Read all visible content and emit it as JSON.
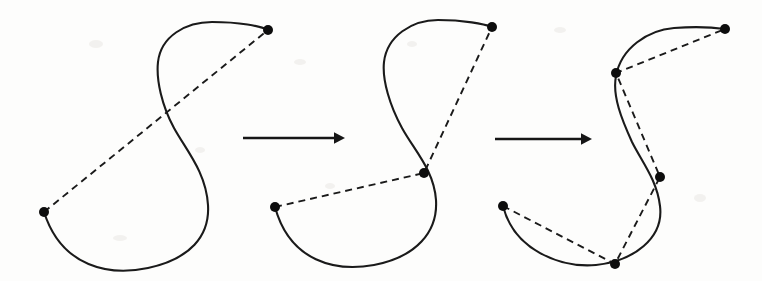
{
  "figure": {
    "background_color": "#fdfdfc",
    "curve_color": "#1a1a1a",
    "chord_color": "#1a1a1a",
    "dot_color": "#0d0d0d",
    "arrow_color": "#161616",
    "width": 762,
    "height": 281
  },
  "panels": [
    {
      "id": "panel-1",
      "label": "stage-1",
      "vertex_count": 2,
      "chord_segment_count": 1,
      "curve_path": "M 44 212 C 62 268 110 276 148 268 C 190 259 210 236 208 205 C 206 172 186 150 174 128 C 162 106 156 80 158 62 C 161 36 186 22 212 22 C 240 22 260 26 268 30",
      "chord_path": "M 44 212 L 268 30",
      "vertices": [
        {
          "name": "endpoint-lower-left",
          "x": 44,
          "y": 212
        },
        {
          "name": "endpoint-upper-right",
          "x": 268,
          "y": 30
        }
      ]
    },
    {
      "id": "panel-2",
      "label": "stage-2",
      "vertex_count": 3,
      "chord_segment_count": 2,
      "curve_path": "M 275 207 C 290 262 336 272 374 265 C 416 257 438 232 436 200 C 434 170 414 150 402 128 C 390 106 382 80 384 62 C 387 36 412 20 438 20 C 464 20 484 24 492 27",
      "chord_path": "M 275 207 L 424 173 L 492 27",
      "vertices": [
        {
          "name": "endpoint-lower-left",
          "x": 275,
          "y": 207
        },
        {
          "name": "midpoint-inflection",
          "x": 424,
          "y": 173
        },
        {
          "name": "endpoint-upper-right",
          "x": 492,
          "y": 27
        }
      ]
    },
    {
      "id": "panel-3",
      "label": "stage-3",
      "vertex_count": 5,
      "chord_segment_count": 4,
      "curve_path": "M 503 206 C 514 250 560 268 596 265 C 634 261 664 238 660 206 C 657 180 642 162 632 142 C 622 120 612 96 616 76 C 621 48 648 30 674 28 C 700 26 718 28 725 29",
      "chord_path": "M 503 206 L 615 264 L 660 177 L 616 73 L 725 29",
      "vertices": [
        {
          "name": "endpoint-lower-left",
          "x": 503,
          "y": 206
        },
        {
          "name": "vertex-bottom",
          "x": 615,
          "y": 264
        },
        {
          "name": "vertex-middle",
          "x": 660,
          "y": 177
        },
        {
          "name": "vertex-upper",
          "x": 616,
          "y": 73
        },
        {
          "name": "endpoint-upper-right",
          "x": 725,
          "y": 29
        }
      ]
    }
  ],
  "arrows": [
    {
      "id": "arrow-1",
      "name": "transition-arrow-one-to-two",
      "x1": 243,
      "y1": 138,
      "x2": 345,
      "y2": 138,
      "head_size": 11
    },
    {
      "id": "arrow-2",
      "name": "transition-arrow-two-to-three",
      "x1": 495,
      "y1": 139,
      "x2": 592,
      "y2": 139,
      "head_size": 11
    }
  ],
  "paper_specks": [
    {
      "x": 96,
      "y": 44,
      "rx": 7,
      "ry": 4
    },
    {
      "x": 300,
      "y": 62,
      "rx": 6,
      "ry": 3
    },
    {
      "x": 412,
      "y": 44,
      "rx": 5,
      "ry": 3
    },
    {
      "x": 560,
      "y": 30,
      "rx": 6,
      "ry": 3
    },
    {
      "x": 120,
      "y": 238,
      "rx": 7,
      "ry": 3
    },
    {
      "x": 330,
      "y": 186,
      "rx": 5,
      "ry": 3
    },
    {
      "x": 700,
      "y": 198,
      "rx": 6,
      "ry": 4
    },
    {
      "x": 200,
      "y": 150,
      "rx": 5,
      "ry": 3
    }
  ]
}
